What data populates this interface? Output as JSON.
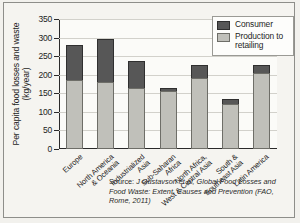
{
  "chart_data": {
    "type": "bar",
    "stacked": true,
    "title": "",
    "xlabel": "",
    "ylabel": "Per capita food losses and waste (kg/year)",
    "ylim": [
      0,
      350
    ],
    "yticks": [
      0,
      50,
      100,
      150,
      200,
      250,
      300,
      350
    ],
    "grid": true,
    "legend_position": "top-right",
    "categories": [
      "Europe",
      "North America\n& Oceania",
      "Industrialized\nAsia",
      "Sub-Saharan\nAfrica",
      "North Africa,\nWest & Central Asia",
      "South &\nSoutheast Asia",
      "Latin America"
    ],
    "series": [
      {
        "name": "Production to retailing",
        "color": "#c0c0ba",
        "values": [
          185,
          180,
          163,
          155,
          190,
          120,
          205
        ]
      },
      {
        "name": "Consumer",
        "color": "#575757",
        "values": [
          95,
          115,
          75,
          8,
          35,
          15,
          20
        ]
      }
    ],
    "totals": [
      280,
      295,
      238,
      163,
      225,
      135,
      225
    ],
    "source_prefix": "Source: ",
    "source": "J Gustavson et al, Global Food Losses and Food Waste: Extent, Causes and Prevention (FAO, Rome, 2011)"
  }
}
